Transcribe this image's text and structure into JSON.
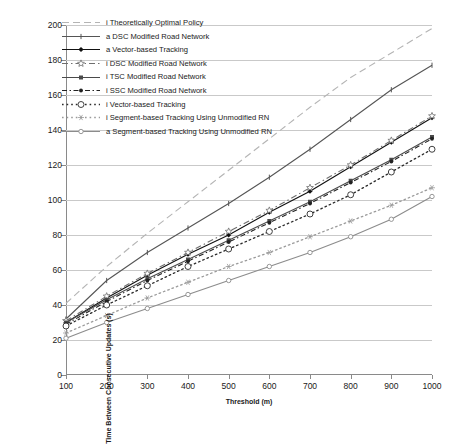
{
  "chart_data": {
    "type": "line",
    "title": "",
    "xlabel": "Threshold (m)",
    "ylabel": "Time Between Consecutive Updates (s)",
    "xlim": [
      100,
      1000
    ],
    "ylim": [
      0,
      200
    ],
    "xticks": [
      100,
      200,
      300,
      400,
      500,
      600,
      700,
      800,
      900,
      1000
    ],
    "yticks": [
      0,
      20,
      40,
      60,
      80,
      100,
      120,
      140,
      160,
      180,
      200
    ],
    "grid": "horizontal",
    "legend_position": "upper-left",
    "x": [
      100,
      200,
      300,
      400,
      500,
      600,
      700,
      800,
      900,
      1000
    ],
    "series": [
      {
        "name": "i Theoretically Optimal Policy",
        "color": "#b4b4b4",
        "style": "dashed",
        "marker": "none",
        "values": [
          41,
          62,
          81,
          99,
          117,
          135,
          153,
          170,
          184,
          198
        ]
      },
      {
        "name": "a DSC Modified Road Network",
        "color": "#555555",
        "style": "solid",
        "marker": "tick",
        "values": [
          32,
          54,
          70,
          84,
          98,
          113,
          129,
          146,
          163,
          177
        ]
      },
      {
        "name": "a Vector-based Tracking",
        "color": "#111111",
        "style": "solid",
        "marker": "diamond",
        "values": [
          30,
          44,
          57,
          69,
          80,
          93,
          105,
          119,
          133,
          147
        ]
      },
      {
        "name": "i DSC Modified Road Network",
        "color": "#6e6e6e",
        "style": "dashdot",
        "marker": "star",
        "values": [
          31,
          45,
          58,
          70,
          82,
          94,
          107,
          120,
          134,
          148
        ]
      },
      {
        "name": "i TSC Modified Road Network",
        "color": "#4a4a4a",
        "style": "solid",
        "marker": "square",
        "values": [
          30,
          43,
          55,
          66,
          77,
          88,
          99,
          111,
          123,
          136
        ]
      },
      {
        "name": "i SSC Modified Road Network",
        "color": "#222222",
        "style": "dashed-dot",
        "marker": "dot",
        "values": [
          29,
          42,
          54,
          65,
          76,
          87,
          98,
          110,
          122,
          135
        ]
      },
      {
        "name": "i Vector-based Tracking",
        "color": "#2b2b2b",
        "style": "dotted",
        "marker": "circle-open",
        "values": [
          28,
          40,
          51,
          62,
          72,
          82,
          92,
          103,
          116,
          129
        ]
      },
      {
        "name": "i Segment-based Tracking Using Unmodified RN",
        "color": "#9a9a9a",
        "style": "dotted",
        "marker": "asterisk",
        "values": [
          24,
          34,
          44,
          53,
          62,
          70,
          79,
          88,
          97,
          107
        ]
      },
      {
        "name": "a Segment-based Tracking Using Unmodified RN",
        "color": "#8c8c8c",
        "style": "solid",
        "marker": "circle-small",
        "values": [
          21,
          30,
          38,
          46,
          54,
          62,
          70,
          79,
          89,
          102
        ]
      }
    ]
  }
}
